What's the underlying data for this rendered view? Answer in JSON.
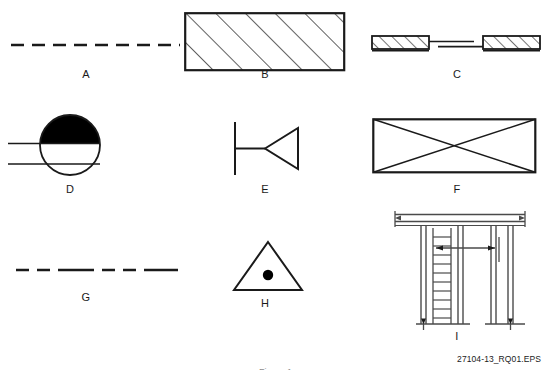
{
  "document": {
    "type": "technical-symbol-sheet",
    "background_color": "#ffffff",
    "line_color": "#1a1a1a",
    "fill_color": "#000000",
    "width": 551,
    "height": 370
  },
  "source_code": "27104-13_RQ01.EPS",
  "caption": "Figure 1",
  "items": [
    {
      "key": "a",
      "label": "A",
      "symbol_name": "dashed-line-uniform",
      "description": "Uniform evenly spaced dashed horizontal line",
      "dash_pattern": "11,7"
    },
    {
      "key": "b",
      "label": "B",
      "symbol_name": "hatched-rectangle",
      "description": "Rectangle filled with diagonal section hatching",
      "hatch_angle_deg": 45
    },
    {
      "key": "c",
      "label": "C",
      "symbol_name": "hatched-blocks-with-break-line",
      "description": "Two hatched end blocks joined by a broken centerline",
      "block_count": 2
    },
    {
      "key": "d",
      "label": "D",
      "symbol_name": "circle-half-filled-with-lines",
      "description": "Circle with solid black upper half and two horizontal lines entering from left",
      "fill_half": "top"
    },
    {
      "key": "e",
      "label": "E",
      "symbol_name": "triangle-on-stem",
      "description": "Vertical bar with horizontal stem terminating in a left-pointing open triangle"
    },
    {
      "key": "f",
      "label": "F",
      "symbol_name": "rectangle-with-diagonals",
      "description": "Rectangle crossed by both diagonals forming an X"
    },
    {
      "key": "g",
      "label": "G",
      "symbol_name": "dash-dash-long-dash-line",
      "description": "Line with repeating short dash, short dash, long dash pattern",
      "dash_pattern": "11,7,11,7,34,7"
    },
    {
      "key": "h",
      "label": "H",
      "symbol_name": "triangle-with-center-dot",
      "description": "Equilateral triangle containing a solid center dot"
    },
    {
      "key": "i",
      "label": "I",
      "symbol_name": "scaffold-elevation-with-ladder",
      "description": "Scaffold frame elevation: top beam, vertical posts, left ladder and dimension arrows"
    }
  ]
}
